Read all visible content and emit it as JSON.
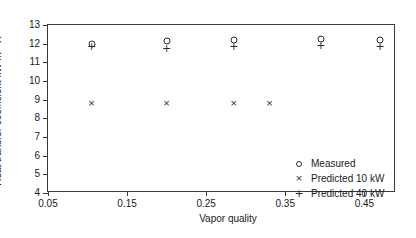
{
  "chart_data": {
    "type": "scatter",
    "title": "",
    "xlabel": "Vapor quality",
    "ylabel": "Heat transfer coefficient kW m-2 K-1",
    "ylabel_parts": {
      "main": "Heat transfer coefficient kW m",
      "sup1": "-2",
      "mid": " K",
      "sup2": "-1"
    },
    "xlim": [
      0.05,
      0.49
    ],
    "ylim": [
      4,
      13
    ],
    "xticks": [
      0.05,
      0.15,
      0.25,
      0.35,
      0.45
    ],
    "xtick_labels": [
      "0.05",
      "0.15",
      "0.25",
      "0.35",
      "0.45"
    ],
    "yticks": [
      4,
      5,
      6,
      7,
      8,
      9,
      10,
      11,
      12,
      13
    ],
    "ytick_labels": [
      "4",
      "5",
      "6",
      "7",
      "8",
      "9",
      "10",
      "11",
      "12",
      "13"
    ],
    "grid": false,
    "legend_position": "lower right",
    "series": [
      {
        "name": "Measured",
        "marker": "circle",
        "x": [
          0.105,
          0.2,
          0.285,
          0.395,
          0.47
        ],
        "y": [
          12.0,
          12.15,
          12.2,
          12.25,
          12.2
        ]
      },
      {
        "name": "Predicted 10 kW",
        "marker": "cross",
        "x": [
          0.105,
          0.2,
          0.285,
          0.33
        ],
        "y": [
          8.8,
          8.8,
          8.8,
          8.8
        ]
      },
      {
        "name": "Predicted 40 kW",
        "marker": "plus",
        "x": [
          0.105,
          0.2,
          0.285,
          0.395,
          0.47
        ],
        "y": [
          11.9,
          11.75,
          11.85,
          11.95,
          11.85
        ]
      }
    ],
    "legend": [
      {
        "label": "Measured",
        "symbol": "circle"
      },
      {
        "label": "Predicted 10 kW",
        "symbol": "cross"
      },
      {
        "label": "Predicted 40 kW",
        "symbol": "plus"
      }
    ]
  }
}
